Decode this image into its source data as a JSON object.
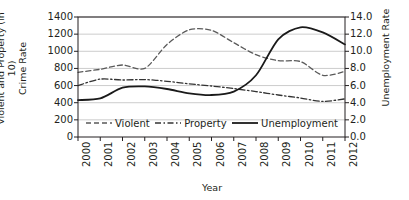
{
  "chart_data": {
    "type": "line",
    "title": "",
    "xlabel": "Year",
    "ylabel": "Violent and Property (in 10)\nCrime Rate",
    "y2label": "Unemployment Rate",
    "categories": [
      "2000",
      "2001",
      "2002",
      "2003",
      "2004",
      "2005",
      "2006",
      "2007",
      "2008",
      "2009",
      "2010",
      "2011",
      "2012"
    ],
    "ylim": [
      0,
      1400
    ],
    "yticks": [
      "0",
      "200",
      "400",
      "600",
      "800",
      "1000",
      "1200",
      "1400"
    ],
    "y2lim": [
      0.0,
      14.0
    ],
    "y2ticks": [
      "0.0",
      "2.0",
      "4.0",
      "6.0",
      "8.0",
      "10.0",
      "12.0",
      "14.0"
    ],
    "grid": true,
    "legend_position": "inside-bottom",
    "series": [
      {
        "name": "Violent",
        "axis": "left",
        "style": "dashed",
        "color": "#5a5a5a",
        "values": [
          755,
          790,
          840,
          800,
          1080,
          1250,
          1245,
          1100,
          960,
          890,
          880,
          720,
          765
        ]
      },
      {
        "name": "Property",
        "axis": "left",
        "style": "dash-dot",
        "color": "#333333",
        "values": [
          600,
          675,
          665,
          670,
          650,
          620,
          595,
          565,
          530,
          490,
          455,
          415,
          445
        ]
      },
      {
        "name": "Unemployment",
        "axis": "right",
        "style": "solid",
        "color": "#1a1a1a",
        "values": [
          4.3,
          4.5,
          5.75,
          5.9,
          5.6,
          5.1,
          4.9,
          5.3,
          7.2,
          11.4,
          12.8,
          12.2,
          10.8
        ]
      }
    ]
  },
  "legend": {
    "items": [
      {
        "label": "Violent"
      },
      {
        "label": "Property"
      },
      {
        "label": "Unemployment"
      }
    ]
  },
  "colors": {
    "axis": "#231f20",
    "grid": "#bfbfbf",
    "background": "#ffffff"
  }
}
